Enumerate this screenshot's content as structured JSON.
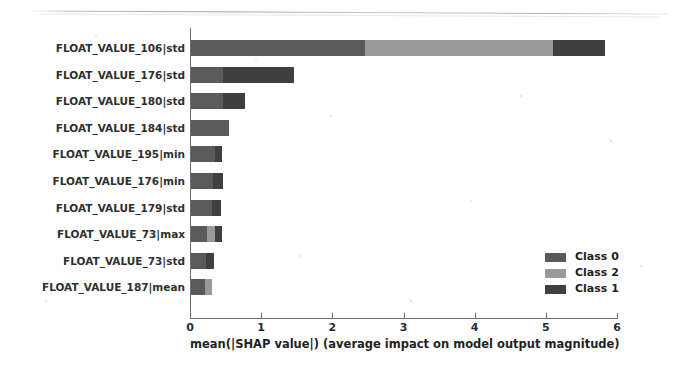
{
  "chart_data": {
    "type": "bar",
    "orientation": "horizontal",
    "stacked": true,
    "title": "",
    "xlabel": "mean(|SHAP value|) (average impact on model output magnitude)",
    "ylabel": "",
    "xlim": [
      0,
      6
    ],
    "xticks": [
      0,
      1,
      2,
      3,
      4,
      5,
      6
    ],
    "xtick_labels": [
      "0",
      "1",
      "2",
      "3",
      "4",
      "5",
      "6"
    ],
    "grid": false,
    "legend_position": "lower right",
    "categories": [
      "FLOAT_VALUE_106|std",
      "FLOAT_VALUE_176|std",
      "FLOAT_VALUE_180|std",
      "FLOAT_VALUE_184|std",
      "FLOAT_VALUE_195|min",
      "FLOAT_VALUE_176|min",
      "FLOAT_VALUE_179|std",
      "FLOAT_VALUE_73|max",
      "FLOAT_VALUE_73|std",
      "FLOAT_VALUE_187|mean"
    ],
    "series": [
      {
        "name": "Class 0",
        "color": "#5a5a5a",
        "values": [
          2.44,
          0.45,
          0.45,
          0.53,
          0.34,
          0.31,
          0.29,
          0.22,
          0.21,
          0.2
        ]
      },
      {
        "name": "Class 2",
        "color": "#9a9a9a",
        "values": [
          2.64,
          0.0,
          0.0,
          0.0,
          0.0,
          0.0,
          0.0,
          0.12,
          0.0,
          0.1
        ]
      },
      {
        "name": "Class 1",
        "color": "#3f3f3f",
        "values": [
          0.74,
          1.0,
          0.31,
          0.0,
          0.09,
          0.14,
          0.13,
          0.1,
          0.12,
          0.0
        ]
      }
    ],
    "totals": [
      5.82,
      1.45,
      0.76,
      0.53,
      0.43,
      0.45,
      0.42,
      0.44,
      0.33,
      0.3
    ]
  },
  "legend": {
    "items": [
      {
        "label": "Class 0",
        "color": "#5a5a5a"
      },
      {
        "label": "Class 2",
        "color": "#9a9a9a"
      },
      {
        "label": "Class 1",
        "color": "#3f3f3f"
      }
    ]
  }
}
